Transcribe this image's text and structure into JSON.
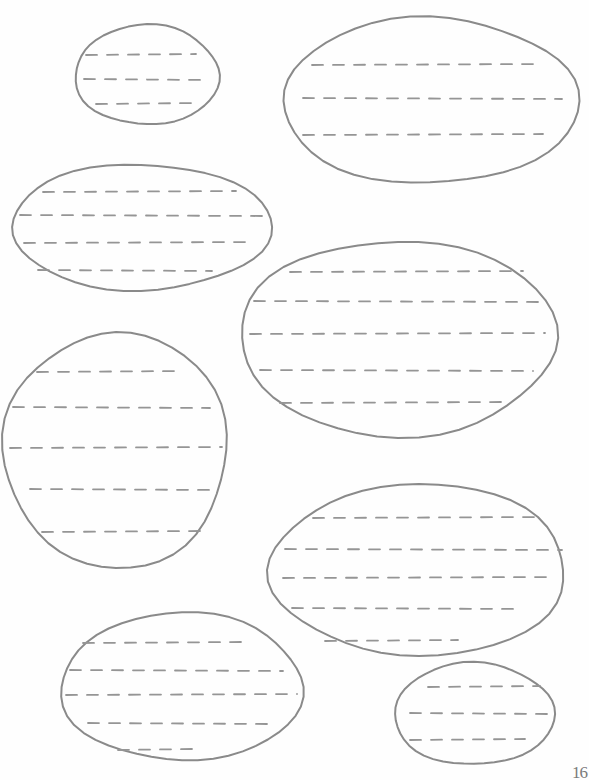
{
  "page": {
    "page_number": "16",
    "stroke_color": "#8a8a8a",
    "dash_color": "#959595",
    "background": "#fefefe"
  },
  "ovals": [
    {
      "id": "oval-1",
      "cx": 147,
      "cy": 75,
      "rx": 72,
      "ry": 50,
      "lines": [
        {
          "y": 55,
          "x1": 86,
          "x2": 196
        },
        {
          "y": 79,
          "x1": 84,
          "x2": 204
        },
        {
          "y": 104,
          "x1": 96,
          "x2": 196
        }
      ]
    },
    {
      "id": "oval-2",
      "cx": 430,
      "cy": 101,
      "rx": 148,
      "ry": 83,
      "lines": [
        {
          "y": 65,
          "x1": 312,
          "x2": 540
        },
        {
          "y": 98,
          "x1": 303,
          "x2": 562
        },
        {
          "y": 135,
          "x1": 303,
          "x2": 543
        }
      ]
    },
    {
      "id": "oval-3",
      "cx": 141,
      "cy": 227,
      "rx": 130,
      "ry": 63,
      "lines": [
        {
          "y": 192,
          "x1": 43,
          "x2": 236
        },
        {
          "y": 215,
          "x1": 20,
          "x2": 262
        },
        {
          "y": 243,
          "x1": 24,
          "x2": 252
        },
        {
          "y": 270,
          "x1": 38,
          "x2": 212
        }
      ]
    },
    {
      "id": "oval-4",
      "cx": 398,
      "cy": 338,
      "rx": 158,
      "ry": 98,
      "lines": [
        {
          "y": 272,
          "x1": 290,
          "x2": 523
        },
        {
          "y": 301,
          "x1": 254,
          "x2": 545
        },
        {
          "y": 334,
          "x1": 250,
          "x2": 545
        },
        {
          "y": 370,
          "x1": 260,
          "x2": 533
        },
        {
          "y": 403,
          "x1": 280,
          "x2": 505
        }
      ]
    },
    {
      "id": "oval-5",
      "cx": 116,
      "cy": 450,
      "rx": 112,
      "ry": 118,
      "lines": [
        {
          "y": 372,
          "x1": 37,
          "x2": 183
        },
        {
          "y": 407,
          "x1": 13,
          "x2": 210
        },
        {
          "y": 448,
          "x1": 10,
          "x2": 222
        },
        {
          "y": 489,
          "x1": 30,
          "x2": 218
        },
        {
          "y": 532,
          "x1": 42,
          "x2": 200
        }
      ]
    },
    {
      "id": "oval-6",
      "cx": 419,
      "cy": 570,
      "rx": 148,
      "ry": 86,
      "lines": [
        {
          "y": 518,
          "x1": 313,
          "x2": 540
        },
        {
          "y": 549,
          "x1": 285,
          "x2": 562
        },
        {
          "y": 578,
          "x1": 283,
          "x2": 553
        },
        {
          "y": 608,
          "x1": 292,
          "x2": 522
        },
        {
          "y": 641,
          "x1": 325,
          "x2": 458
        }
      ]
    },
    {
      "id": "oval-7",
      "cx": 182,
      "cy": 687,
      "rx": 121,
      "ry": 74,
      "lines": [
        {
          "y": 643,
          "x1": 83,
          "x2": 243
        },
        {
          "y": 670,
          "x1": 70,
          "x2": 283
        },
        {
          "y": 695,
          "x1": 66,
          "x2": 297
        },
        {
          "y": 723,
          "x1": 88,
          "x2": 270
        },
        {
          "y": 750,
          "x1": 118,
          "x2": 193
        }
      ]
    },
    {
      "id": "oval-8",
      "cx": 474,
      "cy": 714,
      "rx": 80,
      "ry": 51,
      "lines": [
        {
          "y": 687,
          "x1": 428,
          "x2": 540
        },
        {
          "y": 713,
          "x1": 410,
          "x2": 550
        },
        {
          "y": 740,
          "x1": 410,
          "x2": 525
        }
      ]
    }
  ]
}
